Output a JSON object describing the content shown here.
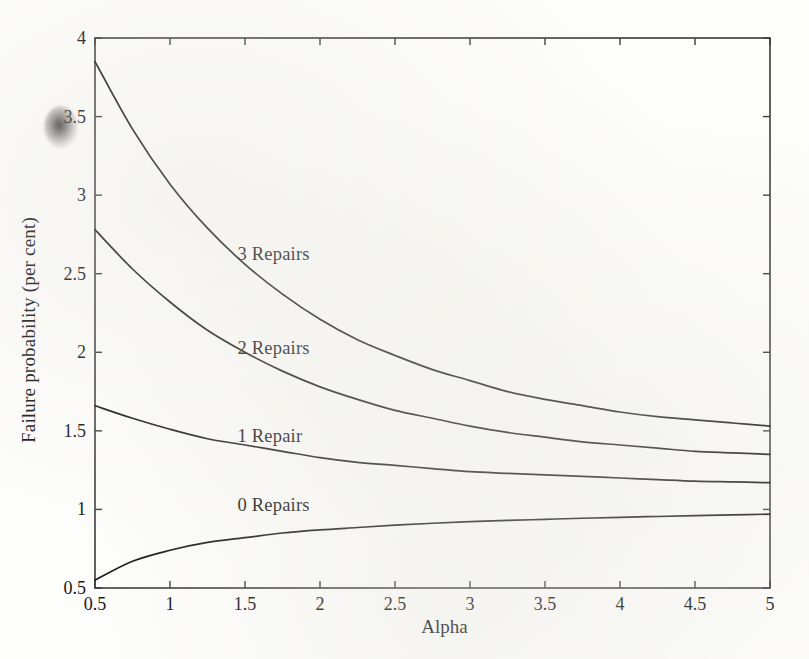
{
  "figure": {
    "background_color": "#fdfdfb",
    "line_color": "#1a1a1a",
    "axis_color": "#3a3a3a"
  },
  "chart_data": {
    "type": "line",
    "title": "",
    "xlabel": "Alpha",
    "ylabel": "Failure probability (per cent)",
    "xlim": [
      0.5,
      5
    ],
    "ylim": [
      0.5,
      4
    ],
    "xticks": [
      0.5,
      1,
      1.5,
      2,
      2.5,
      3,
      3.5,
      4,
      4.5,
      5
    ],
    "xticklabels": [
      "0.5",
      "1",
      "1.5",
      "2",
      "2.5",
      "3",
      "3.5",
      "4",
      "4.5",
      "5"
    ],
    "yticks": [
      0.5,
      1,
      1.5,
      2,
      2.5,
      3,
      3.5,
      4
    ],
    "yticklabels": [
      "0.5",
      "1",
      "1.5",
      "2",
      "2.5",
      "3",
      "3.5",
      "4"
    ],
    "grid": false,
    "legend": "inline-curve-labels",
    "x": [
      0.5,
      0.75,
      1.0,
      1.25,
      1.5,
      1.75,
      2.0,
      2.25,
      2.5,
      2.75,
      3.0,
      3.25,
      3.5,
      3.75,
      4.0,
      4.25,
      4.5,
      4.75,
      5.0
    ],
    "series": [
      {
        "name": "3 Repairs",
        "label": "3 Repairs",
        "label_x": 1.45,
        "label_y": 2.62,
        "values": [
          3.85,
          3.42,
          3.07,
          2.79,
          2.56,
          2.37,
          2.21,
          2.08,
          1.98,
          1.89,
          1.82,
          1.75,
          1.7,
          1.66,
          1.62,
          1.59,
          1.57,
          1.55,
          1.53
        ]
      },
      {
        "name": "2 Repairs",
        "label": "2 Repairs",
        "label_x": 1.45,
        "label_y": 2.02,
        "values": [
          2.78,
          2.53,
          2.32,
          2.14,
          2.0,
          1.88,
          1.78,
          1.7,
          1.63,
          1.58,
          1.53,
          1.49,
          1.46,
          1.43,
          1.41,
          1.39,
          1.37,
          1.36,
          1.35
        ]
      },
      {
        "name": "1 Repair",
        "label": "1 Repair",
        "label_x": 1.45,
        "label_y": 1.46,
        "values": [
          1.66,
          1.58,
          1.51,
          1.45,
          1.41,
          1.37,
          1.33,
          1.3,
          1.28,
          1.26,
          1.24,
          1.23,
          1.22,
          1.21,
          1.2,
          1.19,
          1.18,
          1.175,
          1.17
        ]
      },
      {
        "name": "0 Repairs",
        "label": "0 Repairs",
        "label_x": 1.45,
        "label_y": 1.02,
        "values": [
          0.55,
          0.67,
          0.74,
          0.79,
          0.82,
          0.85,
          0.87,
          0.885,
          0.9,
          0.912,
          0.922,
          0.93,
          0.937,
          0.944,
          0.95,
          0.955,
          0.96,
          0.965,
          0.97
        ]
      }
    ]
  }
}
